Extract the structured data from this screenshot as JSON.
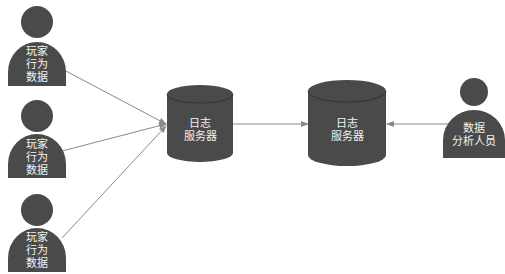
{
  "colors": {
    "shape_fill": "#4a4a4a",
    "shape_top": "#555555",
    "connector": "#8a8a8a",
    "label_text": "#f2f2f2",
    "background": "#ffffff"
  },
  "players": [
    {
      "label": "玩家\n行为\n数据"
    },
    {
      "label": "玩家\n行为\n数据"
    },
    {
      "label": "玩家\n行为\n数据"
    }
  ],
  "log_server_1": {
    "label": "日志\n服务器"
  },
  "log_server_2": {
    "label": "日志\n服务器"
  },
  "analyst": {
    "label": "数据\n分析人员"
  },
  "edges": [
    {
      "from": "player-1",
      "to": "log-server-1"
    },
    {
      "from": "player-2",
      "to": "log-server-1"
    },
    {
      "from": "player-3",
      "to": "log-server-1"
    },
    {
      "from": "log-server-1",
      "to": "log-server-2"
    },
    {
      "from": "analyst",
      "to": "log-server-2"
    }
  ]
}
